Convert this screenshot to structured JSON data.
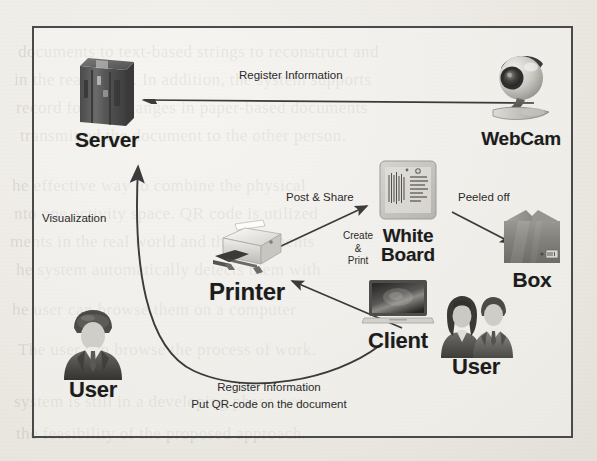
{
  "figure": {
    "nodes": [
      {
        "id": "server",
        "label": "Server",
        "icon": "server-rack-icon"
      },
      {
        "id": "webcam",
        "label": "WebCam",
        "icon": "webcam-icon"
      },
      {
        "id": "whiteboard",
        "label": "White\nBoard",
        "label_line1": "White",
        "label_line2": "Board",
        "icon": "whiteboard-document-icon"
      },
      {
        "id": "box",
        "label": "Box",
        "icon": "cardboard-box-icon"
      },
      {
        "id": "printer",
        "label": "Printer",
        "icon": "printer-icon"
      },
      {
        "id": "client",
        "label": "Client",
        "icon": "laptop-icon"
      },
      {
        "id": "user_right",
        "label": "User",
        "icon": "two-people-icon"
      },
      {
        "id": "user_left",
        "label": "User",
        "icon": "businessman-icon"
      }
    ],
    "edges": [
      {
        "id": "register_top",
        "label": "Register Information",
        "from": "webcam",
        "to": "server",
        "style": "straight-left"
      },
      {
        "id": "visualization",
        "label": "Visualization",
        "from": "server",
        "to": "user_left",
        "style": "straight-down"
      },
      {
        "id": "post_share",
        "label": "Post & Share",
        "from": "printer",
        "to": "whiteboard",
        "style": "diagonal-up-right"
      },
      {
        "id": "peeled_off",
        "label": "Peeled off",
        "from": "whiteboard",
        "to": "box",
        "style": "diagonal-down-right"
      },
      {
        "id": "create_print",
        "label_line1": "Create",
        "label_line2": "&",
        "label_line3": "Print",
        "from": "client",
        "to": "printer",
        "style": "diagonal-up-left"
      },
      {
        "id": "register_curve",
        "label_line1": "Register Information",
        "label_line2": "Put QR-code on the document",
        "from": "client",
        "to": "server",
        "style": "curve-u"
      }
    ]
  },
  "ghost_text": {
    "lines": [
      "documents to text-based strings to reconstruct and",
      "in the real world. In addition, the system supports",
      "record for the changes in paper-based documents",
      "transmitted the document to the other person.",
      "he effective way to combine the physical",
      "nto one activity space. QR code is utilized",
      "ments in the real world and the documents",
      "he system automatically detects them with",
      "he user can browse them on a computer",
      "The user can browse the process of work.",
      "system is still in a developing phase, we",
      "the feasibility of the proposed approach."
    ]
  },
  "colors": {
    "frame_border": "#4a4a4a",
    "paper": "#eeece7",
    "arrow": "#3a3a3a",
    "label_text": "#1c1c1c"
  }
}
